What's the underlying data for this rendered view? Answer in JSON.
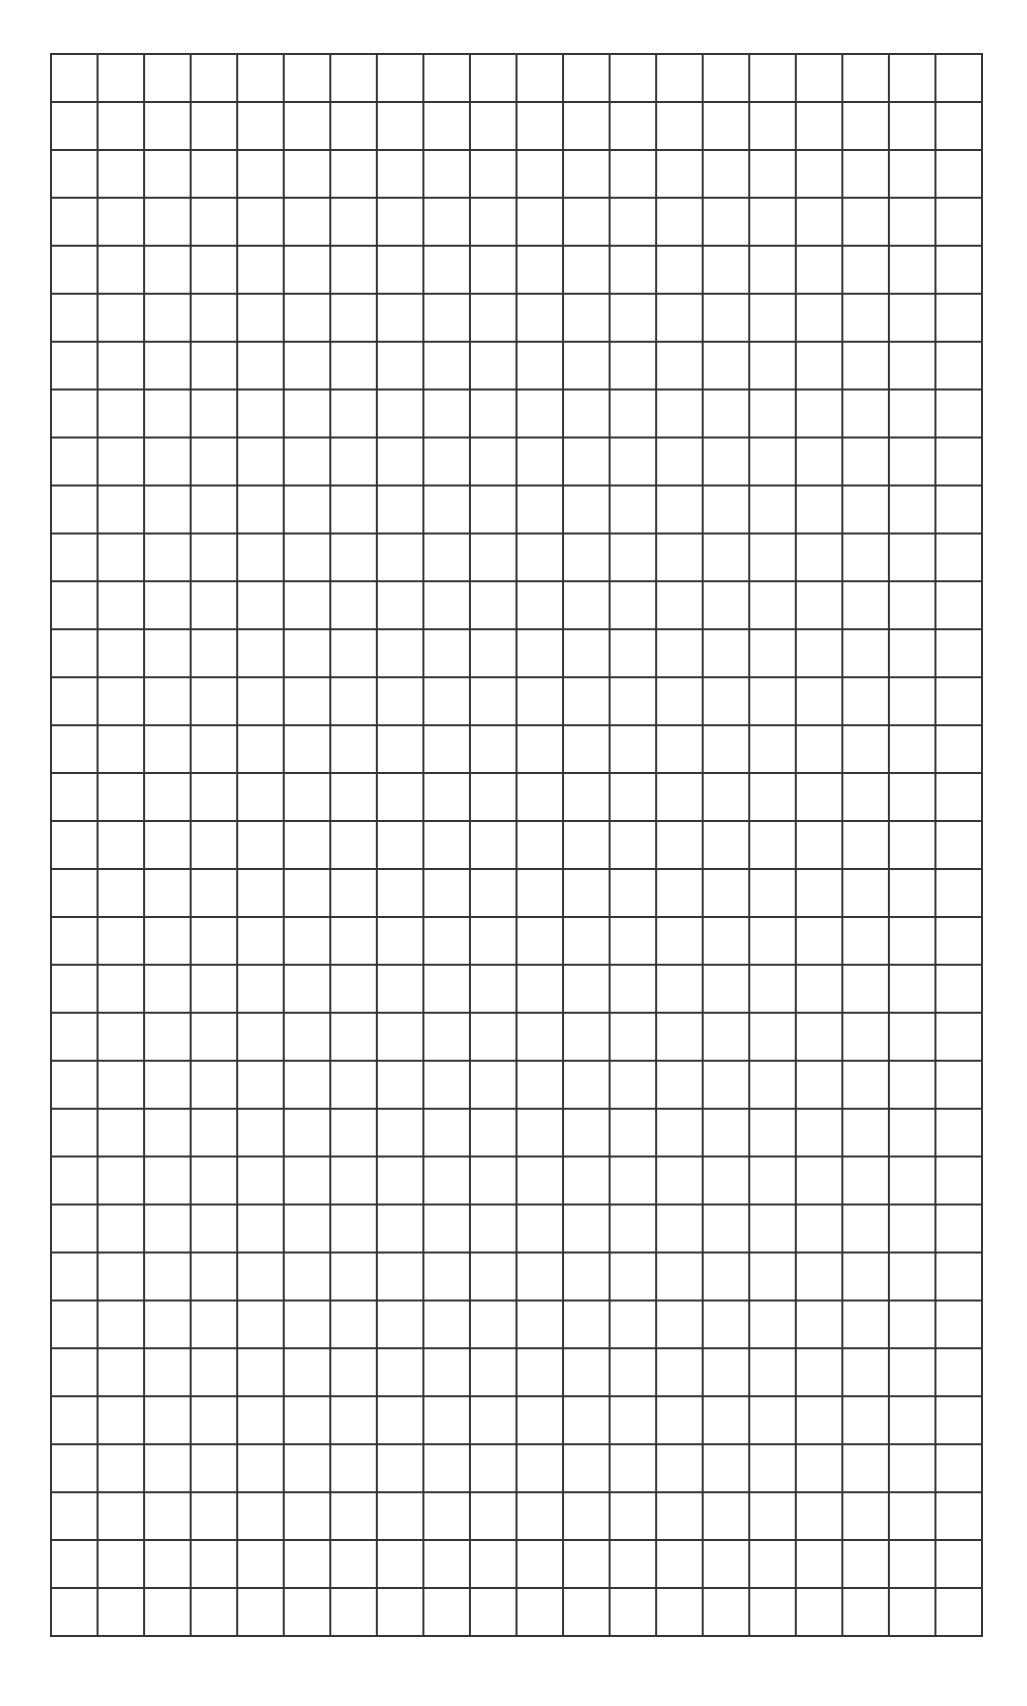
{
  "page": {
    "type": "blank-graph-paper",
    "width": 1027,
    "height": 1706,
    "background_color": "#ffffff"
  },
  "grid": {
    "columns": 20,
    "rows": 33,
    "left": 50,
    "top": 53,
    "width": 933,
    "height": 1584,
    "line_color": "#353535",
    "line_width": 2,
    "cell_width": 46.65,
    "cell_height": 48
  }
}
